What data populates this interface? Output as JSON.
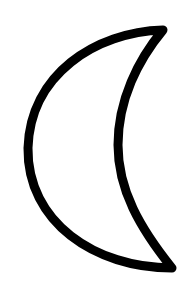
{
  "image": {
    "subject": "crescent moon outline",
    "icon": "crescent-moon-icon",
    "background_color": "#ffffff",
    "stroke_color": "#000000",
    "fill_color": "#ffffff",
    "stroke_width": 9
  }
}
